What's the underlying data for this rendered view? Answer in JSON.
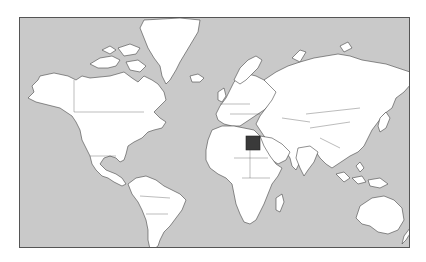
{
  "map": {
    "type": "world-political-outline",
    "projection": "mercator",
    "colors": {
      "ocean": "#c9c9c9",
      "land": "#ffffff",
      "border": "#444444",
      "highlight": "#3a3a3a",
      "frame": "#555555",
      "page": "#ffffff"
    },
    "highlighted_country": {
      "name": "Egypt",
      "color": "#3a3a3a"
    },
    "label": "Egypt highlighted on world map"
  }
}
